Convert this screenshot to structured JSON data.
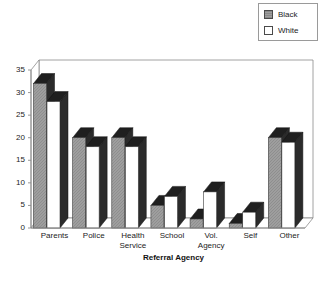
{
  "chart_data": {
    "type": "bar",
    "title": "",
    "xlabel": "Referral Agency",
    "ylabel": "",
    "categories": [
      "Parents",
      "Police",
      "Health\nService",
      "School",
      "Vol.\nAgency",
      "Self",
      "Other"
    ],
    "series": [
      {
        "name": "Black",
        "values": [
          32,
          20,
          20,
          5,
          2,
          1,
          20
        ],
        "color": "#9e9e9e"
      },
      {
        "name": "White",
        "values": [
          28,
          18,
          18,
          7,
          8,
          3.5,
          19
        ],
        "color": "#ffffff"
      }
    ],
    "ylim": [
      0,
      35
    ],
    "yticks": [
      0,
      5,
      10,
      15,
      20,
      25,
      30,
      35
    ],
    "ytick_labels": [
      "0",
      "5",
      "10",
      "15",
      "20",
      "25",
      "30",
      "35"
    ],
    "grid": false,
    "style": "3d-column",
    "legend_position": "top-right"
  },
  "legend": {
    "entries": [
      {
        "label": "Black",
        "swatch": "gray-hatched-swatch"
      },
      {
        "label": "White",
        "swatch": "white-swatch"
      }
    ]
  },
  "axes": {
    "x_title": "Referral Agency",
    "y_tick_labels": [
      "35",
      "30",
      "25",
      "20",
      "15",
      "10",
      "5",
      "0"
    ]
  },
  "colors": {
    "series_black_face": "#9e9e9e",
    "series_white_face": "#ffffff",
    "bar_side": "#2b2b2b",
    "bar_top_dark": "#1f1f1f",
    "bar_top_light": "#c9c9c9",
    "frame": "#8c8c8c",
    "text": "#1c1c1c",
    "background": "#ffffff"
  }
}
